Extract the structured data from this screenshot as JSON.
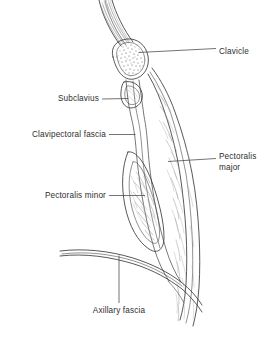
{
  "figure": {
    "background_color": "#ffffff",
    "line_color": "#3a3a3a",
    "text_color": "#2e2e2e",
    "width": 277,
    "height": 337
  },
  "labels": [
    {
      "id": "clavicle",
      "text": "Clavicle",
      "lines": [
        "Clavicle"
      ],
      "align": "start",
      "text_x": 219,
      "text_y": 54,
      "leader": "M 138.5 52.5 L 216 48.5"
    },
    {
      "id": "subclavius",
      "text": "Subclavius",
      "lines": [
        "Subclavius"
      ],
      "align": "end",
      "text_x": 99,
      "text_y": 101,
      "leader": "M 102 99 L 128.5 98.5"
    },
    {
      "id": "clavipectoral-fascia",
      "text": "Clavipectoral fascia",
      "lines": [
        "Clavipectoral fascia"
      ],
      "align": "end",
      "text_x": 106,
      "text_y": 137,
      "leader": "M 109 134.5 L 135.5 134.5"
    },
    {
      "id": "pectoralis-minor",
      "text": "Pectoralis minor",
      "lines": [
        "Pectoralis minor"
      ],
      "align": "end",
      "text_x": 106,
      "text_y": 198,
      "leader": "M 109 195.5 L 145 195.5"
    },
    {
      "id": "pectoralis-major",
      "text": "Pectoralis major",
      "lines": [
        "Pectoralis",
        "major"
      ],
      "align": "start",
      "text_x": 219,
      "text_y": 159,
      "line_height": 11,
      "leader": "M 168 161.5 L 216 158.5"
    },
    {
      "id": "axillary-fascia",
      "text": "Axillary fascia",
      "lines": [
        "Axillary fascia"
      ],
      "align": "middle",
      "text_x": 119,
      "text_y": 313,
      "leader": "M 119 255.5 L 119 303"
    }
  ],
  "structures": [
    {
      "id": "clavicle-bone",
      "name": "Clavicle",
      "description": "Oval cross-section of bone with cancellous stipple"
    },
    {
      "id": "subclavius-muscle",
      "name": "Subclavius",
      "description": "Small triangular muscle beneath clavicle"
    },
    {
      "id": "clavipectoral-fascia-band",
      "name": "Clavipectoral fascia",
      "description": "Narrow fascial band descending from clavicle"
    },
    {
      "id": "pectoralis-minor-muscle",
      "name": "Pectoralis minor",
      "description": "Elongated oval muscle belly in fascia sheath"
    },
    {
      "id": "pectoralis-major-muscle",
      "name": "Pectoralis major",
      "description": "Long crescent muscle band along anterior chest wall"
    },
    {
      "id": "axillary-fascia-sheet",
      "name": "Axillary fascia",
      "description": "Curved fascial sheet sweeping across the axilla floor"
    }
  ]
}
